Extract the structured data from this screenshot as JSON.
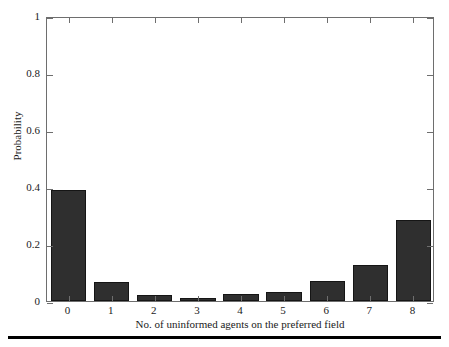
{
  "chart_data": {
    "type": "bar",
    "title": "",
    "subtitle": "",
    "xlabel": "No. of uninformed agents on the preferred field",
    "ylabel": "Probability",
    "categories": [
      "0",
      "1",
      "2",
      "3",
      "4",
      "5",
      "6",
      "7",
      "8"
    ],
    "values": [
      0.39,
      0.065,
      0.02,
      0.01,
      0.023,
      0.032,
      0.069,
      0.125,
      0.285
    ],
    "xlim": [
      -0.5,
      8.5
    ],
    "ylim": [
      0,
      1
    ],
    "ytick_labels": [
      "0",
      "0.2",
      "0.4",
      "0.6",
      "0.8",
      "1"
    ],
    "ytick_values": [
      0,
      0.2,
      0.4,
      0.6,
      0.8,
      1
    ],
    "xtick_labels": [
      "0",
      "1",
      "2",
      "3",
      "4",
      "5",
      "6",
      "7",
      "8"
    ],
    "grid": false,
    "legend": null,
    "legend_position": "none",
    "bar_color": "#2f2f2f",
    "bar_edge_color": "#151515",
    "axis_color": "#6e6e6e",
    "background_color": "#ffffff",
    "bar_width_fraction": 0.82
  },
  "figure": {
    "rule_color": "#000000"
  }
}
